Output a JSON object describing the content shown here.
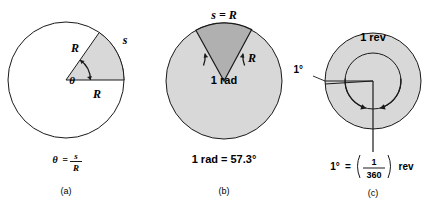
{
  "figure": {
    "type": "diagram",
    "background": "#ffffff",
    "stroke_color": "#1a1a1a",
    "fill_light": "#d8d8d8",
    "fill_dark": "#b0b0b0",
    "panels": [
      {
        "id": "a",
        "caption": "(a)",
        "formula": {
          "lhs": "θ",
          "equals": "=",
          "numerator": "s",
          "denominator": "R"
        },
        "labels": {
          "radius_upper": "R",
          "radius_lower": "R",
          "arc": "s",
          "angle": "θ"
        },
        "geometry": {
          "center_x": 66,
          "center_y": 80,
          "radius": 58,
          "wedge_start_deg": 0,
          "wedge_end_deg": 55,
          "fill": "#d8d8d8",
          "circle_fill": "#ffffff"
        }
      },
      {
        "id": "b",
        "caption": "(b)",
        "formula_text": "1 rad = 57.3°",
        "labels": {
          "arc": "s = R",
          "radius": "R",
          "angle": "1 rad"
        },
        "geometry": {
          "center_x": 224,
          "center_y": 81,
          "radius": 58,
          "wedge_start_deg": 61,
          "wedge_end_deg": 118,
          "wedge_fill": "#b0b0b0",
          "circle_fill": "#d8d8d8"
        }
      },
      {
        "id": "c",
        "caption": "(c)",
        "formula": {
          "lhs": "1°",
          "equals": "=",
          "numerator": "1",
          "denominator": "360",
          "unit": "rev"
        },
        "labels": {
          "revolution": "1 rev",
          "degree": "1°"
        },
        "geometry": {
          "center_x": 373,
          "center_y": 81,
          "outer_radius": 48,
          "inner_radius": 28,
          "fill": "#d8d8d8"
        }
      }
    ]
  }
}
